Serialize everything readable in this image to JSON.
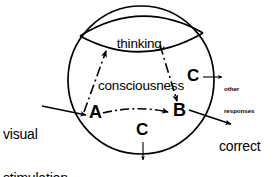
{
  "diagram": {
    "title_text": "thinking, consciousness",
    "lens": {
      "line1": "thinking,",
      "line2": "consciousness",
      "name": "thinking-consciousness-region"
    },
    "nodes": {
      "a": "A",
      "b": "B",
      "c_right": "C",
      "c_bottom": "C"
    },
    "inputs": {
      "stimulus_line1": "visual",
      "stimulus_line2": "stimulation"
    },
    "outputs": {
      "correct_line1": "correct",
      "correct_line2": "response",
      "other_right_line1": "other",
      "other_right_line2": "responses",
      "other_bottom_line1": "other",
      "other_bottom_line2": "responses"
    },
    "colors": {
      "stroke": "#000000",
      "background": "#ffffff",
      "text": "#000000"
    },
    "geometry": {
      "circle_cx": 141,
      "circle_cy": 80,
      "circle_rx": 73,
      "circle_ry": 74
    }
  }
}
